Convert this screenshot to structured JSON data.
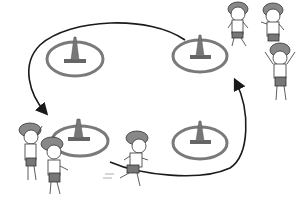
{
  "scene": {
    "description": "Illustration of children running a relay course around four traffic cones placed inside rings",
    "style": "grayscale clip-art",
    "colors": {
      "background": "#ffffff",
      "cone": "#777777",
      "cone_base": "#666666",
      "ring": "#7a7a7a",
      "path": "#1a1a1a",
      "cap": "#888888",
      "shorts": "#777777",
      "skin": "#ffffff",
      "outline": "#333333"
    },
    "cones": [
      {
        "id": "top-left",
        "cx": 75,
        "cy": 58
      },
      {
        "id": "top-right",
        "cx": 200,
        "cy": 55
      },
      {
        "id": "bottom-left",
        "cx": 75,
        "cy": 140
      },
      {
        "id": "bottom-right",
        "cx": 200,
        "cy": 140
      }
    ],
    "path_direction": "counter-clockwise arrows on the left and right sides",
    "children": [
      {
        "id": "waiting-top-1",
        "pose": "standing",
        "x": 238,
        "y": 0
      },
      {
        "id": "waiting-top-2",
        "pose": "cheering",
        "x": 264,
        "y": 2
      },
      {
        "id": "waiting-top-3",
        "pose": "arms-raised",
        "x": 268,
        "y": 44
      },
      {
        "id": "waiting-left-1",
        "pose": "waving",
        "x": 18,
        "y": 120
      },
      {
        "id": "waiting-left-2",
        "pose": "standing",
        "x": 44,
        "y": 140
      },
      {
        "id": "runner",
        "pose": "running",
        "x": 122,
        "y": 130
      }
    ]
  }
}
